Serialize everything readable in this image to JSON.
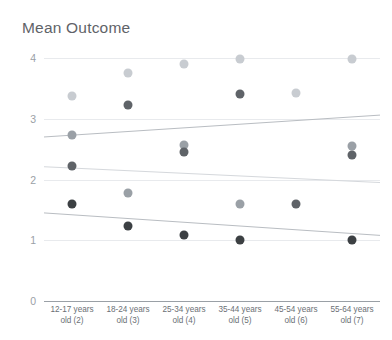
{
  "chart_data": {
    "type": "scatter",
    "title": "Mean Outcome",
    "xlabel": "",
    "ylabel": "",
    "ylim": [
      0,
      4
    ],
    "yticks": [
      0,
      1,
      2,
      3,
      4
    ],
    "grid": true,
    "legend": "none",
    "categories": [
      "12-17 years\nold (2)",
      "18-24 years\nold (3)",
      "25-34 years\nold (4)",
      "35-44 years\nold (5)",
      "45-54 years\nold (6)",
      "55-64 years\nold (7)"
    ],
    "series": [
      {
        "name": "Series 1",
        "color": "#c8ccd1",
        "values": [
          3.38,
          3.75,
          3.9,
          3.98,
          3.42,
          3.99
        ]
      },
      {
        "name": "Series 2",
        "color": "#9aa0a6",
        "values": [
          2.74,
          1.78,
          2.56,
          1.6,
          null,
          2.55
        ]
      },
      {
        "name": "Series 3",
        "color": "#5f6368",
        "values": [
          2.22,
          3.23,
          2.45,
          3.4,
          1.6,
          2.4
        ]
      },
      {
        "name": "Series 4",
        "color": "#3c4043",
        "values": [
          1.6,
          1.23,
          1.08,
          1.0,
          null,
          1.0
        ]
      }
    ],
    "trendlines": [
      {
        "name": "upper-trend",
        "color": "#b9bdc2",
        "y_start": 2.7,
        "y_end": 3.06
      },
      {
        "name": "middle-trend",
        "color": "#d5d8dc",
        "y_start": 2.21,
        "y_end": 1.95
      },
      {
        "name": "lower-trend",
        "color": "#b9bdc2",
        "y_start": 1.45,
        "y_end": 1.08
      }
    ]
  },
  "axis": {
    "y_tick_labels": [
      "0",
      "1",
      "2",
      "3",
      "4"
    ]
  }
}
